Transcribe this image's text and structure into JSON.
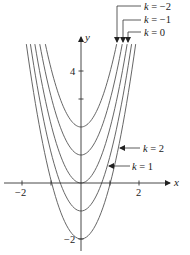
{
  "figure": {
    "type": "family-of-curves",
    "equation_form": "y = 2x^2 - k",
    "colors": {
      "curve": "#555555",
      "axis": "#333333",
      "text": "#222222"
    },
    "axes": {
      "x_label": "x",
      "y_label": "y",
      "x_ticks": [
        {
          "value": -2,
          "label": "−2"
        },
        {
          "value": -1,
          "label": ""
        },
        {
          "value": 0,
          "label": ""
        },
        {
          "value": 1,
          "label": ""
        },
        {
          "value": 2,
          "label": "2"
        }
      ],
      "y_ticks": [
        {
          "value": 4,
          "label": "4"
        },
        {
          "value": 3,
          "label": ""
        },
        {
          "value": -2,
          "label": "−2"
        }
      ]
    },
    "curves": [
      {
        "k": -2,
        "vertex_y": 2
      },
      {
        "k": -1,
        "vertex_y": 1
      },
      {
        "k": 0,
        "vertex_y": 0
      },
      {
        "k": 1,
        "vertex_y": -1
      },
      {
        "k": 2,
        "vertex_y": -2
      }
    ],
    "annotations": {
      "k_neg2": {
        "var": "k",
        "text": " = −2"
      },
      "k_neg1": {
        "var": "k",
        "text": " = −1"
      },
      "k_0": {
        "var": "k",
        "text": " = 0"
      },
      "k_2": {
        "var": "k",
        "text": " = 2"
      },
      "k_1": {
        "var": "k",
        "text": " = 1"
      }
    }
  }
}
